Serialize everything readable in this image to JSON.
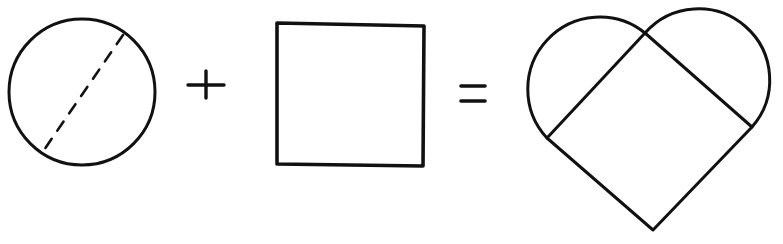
{
  "diagram": {
    "ink_color": "#111111",
    "background": "#ffffff",
    "elements": [
      {
        "id": "circle",
        "label": "circle with dashed diameter"
      },
      {
        "id": "plus",
        "label": "+"
      },
      {
        "id": "square",
        "label": "square"
      },
      {
        "id": "equals",
        "label": "="
      },
      {
        "id": "heart",
        "label": "heart made of a rotated square and two semicircles"
      }
    ],
    "operators": {
      "plus": "+",
      "equals": "="
    }
  }
}
